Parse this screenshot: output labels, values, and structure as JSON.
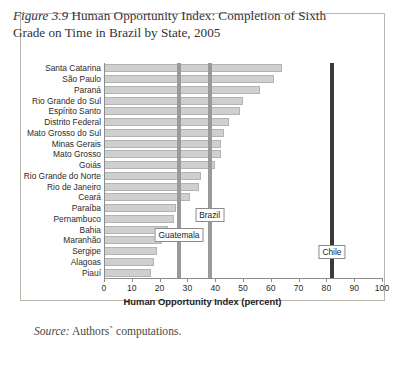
{
  "figure": {
    "number_label": "Figure 3.9",
    "title": "Human Opportunity Index: Completion of Sixth Grade on Time in Brazil by State, 2005",
    "source_label": "Source:",
    "source_text": "Authors` computations."
  },
  "colors": {
    "bar_fill": "#cfcfcf",
    "bar_border": "#b3b3b3",
    "reference_gray": "#9a9a9a",
    "reference_dark": "#3a3a3a",
    "axis": "#8d8d8d",
    "frame": "#b9b6ae"
  },
  "chart_data": {
    "type": "bar",
    "orientation": "horizontal",
    "title": "Human Opportunity Index: Completion of Sixth Grade on Time in Brazil by State, 2005",
    "xlabel": "Human Opportunity Index (percent)",
    "ylabel": "",
    "xlim": [
      0,
      100
    ],
    "xticks": [
      0,
      10,
      20,
      30,
      40,
      50,
      60,
      70,
      80,
      90,
      100
    ],
    "grid": false,
    "legend": "none",
    "categories": [
      "Santa Catarina",
      "São Paulo",
      "Paraná",
      "Rio Grande do Sul",
      "Espírito Santo",
      "Distrito Federal",
      "Mato Grosso do Sul",
      "Minas Gerais",
      "Mato Grosso",
      "Goiás",
      "Rio Grande do Norte",
      "Rio de Janeiro",
      "Ceará",
      "Paraíba",
      "Pernambuco",
      "Bahia",
      "Maranhão",
      "Sergipe",
      "Alagoas",
      "Piauí"
    ],
    "values": [
      64,
      61,
      56,
      50,
      49,
      45,
      43,
      42,
      42,
      40,
      35,
      34,
      31,
      26,
      25,
      23,
      21,
      19,
      18,
      17
    ],
    "annotations": [
      {
        "name": "Guatemala",
        "value": 27,
        "style": "gray-line"
      },
      {
        "name": "Brazil",
        "value": 38,
        "style": "gray-line"
      },
      {
        "name": "Chile",
        "value": 82,
        "style": "dark-line"
      }
    ]
  }
}
